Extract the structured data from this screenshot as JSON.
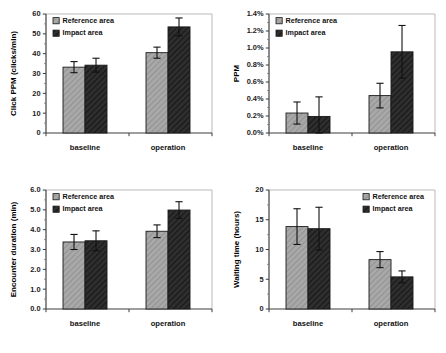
{
  "figure": {
    "layout": "2x2 grid of grouped bar charts with error bars",
    "series_names": [
      "Reference area",
      "Impact area"
    ],
    "colors": {
      "reference_area": "#a8a8a8",
      "impact_area": "#2e2e2e",
      "axis": "#3c3c3c",
      "frame": "#b9b9b9",
      "error_bar": "#111111",
      "background": "#ffffff"
    }
  },
  "legend": {
    "reference_label": "Reference area",
    "impact_label": "Impact area"
  },
  "chart_data": [
    {
      "id": "click-ppm",
      "type": "bar",
      "title": "",
      "xlabel": "",
      "ylabel": "Click PPM (clicks/min)",
      "categories": [
        "baseline",
        "operation"
      ],
      "ylim": [
        0,
        60
      ],
      "yticks": [
        0,
        10,
        20,
        30,
        40,
        50,
        60
      ],
      "ytick_labels": [
        "0",
        "10",
        "20",
        "30",
        "40",
        "50",
        "60"
      ],
      "grid": false,
      "legend_position": "top-left",
      "series": [
        {
          "name": "Reference area",
          "values": [
            33.2,
            40.5
          ],
          "errors": [
            2.8,
            2.8
          ]
        },
        {
          "name": "Impact area",
          "values": [
            34.2,
            53.5
          ],
          "errors": [
            3.5,
            4.5
          ]
        }
      ]
    },
    {
      "id": "ppm-percent",
      "type": "bar",
      "title": "",
      "xlabel": "",
      "ylabel": "PPM",
      "categories": [
        "baseline",
        "operation"
      ],
      "ylim": [
        0,
        1.4
      ],
      "yticks": [
        0,
        0.2,
        0.4,
        0.6,
        0.8,
        1.0,
        1.2,
        1.4
      ],
      "ytick_labels": [
        "0.0%",
        "0.2%",
        "0.4%",
        "0.6%",
        "0.8%",
        "1.0%",
        "1.2%",
        "1.4%"
      ],
      "grid": false,
      "legend_position": "top-left",
      "series": [
        {
          "name": "Reference area",
          "values": [
            0.235,
            0.44
          ],
          "errors": [
            0.13,
            0.145
          ]
        },
        {
          "name": "Impact area",
          "values": [
            0.195,
            0.955
          ],
          "errors": [
            0.23,
            0.31
          ]
        }
      ]
    },
    {
      "id": "encounter-duration",
      "type": "bar",
      "title": "",
      "xlabel": "",
      "ylabel": "Encounter duration (min)",
      "categories": [
        "baseline",
        "operation"
      ],
      "ylim": [
        0,
        6
      ],
      "yticks": [
        0,
        1,
        2,
        3,
        4,
        5,
        6
      ],
      "ytick_labels": [
        "0.0",
        "1.0",
        "2.0",
        "3.0",
        "4.0",
        "5.0",
        "6.0"
      ],
      "grid": false,
      "legend_position": "top-left",
      "series": [
        {
          "name": "Reference area",
          "values": [
            3.38,
            3.92
          ],
          "errors": [
            0.38,
            0.32
          ]
        },
        {
          "name": "Impact area",
          "values": [
            3.44,
            4.99
          ],
          "errors": [
            0.5,
            0.42
          ]
        }
      ]
    },
    {
      "id": "waiting-time",
      "type": "bar",
      "title": "",
      "xlabel": "",
      "ylabel": "Waiting time (hours)",
      "categories": [
        "baseline",
        "operation"
      ],
      "ylim": [
        0,
        20
      ],
      "yticks": [
        0,
        5,
        10,
        15,
        20
      ],
      "ytick_labels": [
        "0",
        "5",
        "10",
        "15",
        "20"
      ],
      "grid": false,
      "legend_position": "top-right",
      "series": [
        {
          "name": "Reference area",
          "values": [
            13.85,
            8.3
          ],
          "errors": [
            3.0,
            1.35
          ]
        },
        {
          "name": "Impact area",
          "values": [
            13.5,
            5.4
          ],
          "errors": [
            3.6,
            1.0
          ]
        }
      ]
    }
  ]
}
